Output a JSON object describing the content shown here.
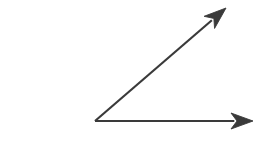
{
  "canvas": {
    "width": 280,
    "height": 145,
    "background_color": "#ffffff"
  },
  "figure": {
    "kind": "geometry-angle-diagram",
    "stroke_color": "#3a3a3a",
    "stroke_width": 2.2,
    "vertex": {
      "x": 95,
      "y": 121
    },
    "angle_degrees": 40,
    "rays": [
      {
        "name": "horizontal-ray",
        "label": "",
        "from": {
          "x": 95,
          "y": 121
        },
        "to": {
          "x": 253,
          "y": 121
        },
        "direction_degrees": 0,
        "has_arrowhead": true,
        "arrowhead_style": "solid-barbed"
      },
      {
        "name": "diagonal-ray",
        "label": "",
        "from": {
          "x": 95,
          "y": 121
        },
        "to": {
          "x": 226,
          "y": 8
        },
        "direction_degrees": 40.8,
        "has_arrowhead": true,
        "arrowhead_style": "solid-barbed"
      }
    ],
    "arrowhead": {
      "length": 22,
      "half_width": 8,
      "notch": 6
    },
    "labels": []
  }
}
